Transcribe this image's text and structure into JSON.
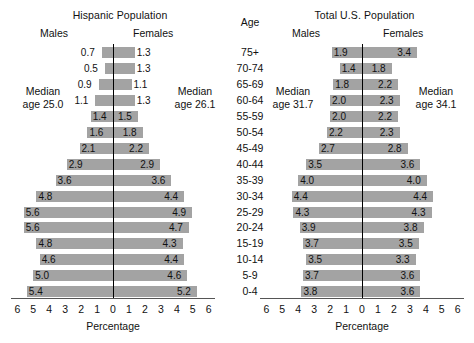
{
  "figure": {
    "age_header": "Age",
    "axis_caption": "Percentage",
    "males_label": "Males",
    "females_label": "Females",
    "bar_color": "#a3a3a3",
    "axis_color": "#000000"
  },
  "age_groups": [
    "75+",
    "70-74",
    "65-69",
    "60-64",
    "55-59",
    "50-54",
    "45-49",
    "40-44",
    "35-39",
    "30-34",
    "25-29",
    "20-24",
    "15-19",
    "10-14",
    "5-9",
    "0-4"
  ],
  "axis_ticks": [
    "6",
    "5",
    "4",
    "3",
    "2",
    "1",
    "0",
    "1",
    "2",
    "3",
    "4",
    "5",
    "6"
  ],
  "charts": [
    {
      "title": "Hispanic Population",
      "median_male": "Median\nage 25.0",
      "median_male_line1": "Median",
      "median_male_line2": "age 25.0",
      "median_female_line1": "Median",
      "median_female_line2": "age 26.1",
      "males": [
        "0.7",
        "0.5",
        "0.9",
        "1.1",
        "1.4",
        "1.6",
        "2.1",
        "2.9",
        "3.6",
        "4.8",
        "5.6",
        "5.6",
        "4.8",
        "4.6",
        "5.0",
        "5.4"
      ],
      "females": [
        "1.3",
        "1.3",
        "1.1",
        "1.3",
        "1.5",
        "1.8",
        "2.2",
        "2.9",
        "3.6",
        "4.4",
        "4.9",
        "4.7",
        "4.3",
        "4.4",
        "4.6",
        "5.2"
      ]
    },
    {
      "title": "Total U.S. Population",
      "median_male_line1": "Median",
      "median_male_line2": "age 31.7",
      "median_female_line1": "Median",
      "median_female_line2": "age 34.1",
      "males": [
        "1.9",
        "1.4",
        "1.8",
        "2.0",
        "2.0",
        "2.2",
        "2.7",
        "3.5",
        "4.0",
        "4.4",
        "4.3",
        "3.9",
        "3.7",
        "3.5",
        "3.7",
        "3.8"
      ],
      "females": [
        "3.4",
        "1.8",
        "2.2",
        "2.3",
        "2.2",
        "2.3",
        "2.8",
        "3.6",
        "4.0",
        "4.4",
        "4.3",
        "3.8",
        "3.5",
        "3.3",
        "3.6",
        "3.6"
      ]
    }
  ],
  "chart_data": {
    "type": "bar",
    "subtype": "population-pyramid",
    "categories": [
      "75+",
      "70-74",
      "65-69",
      "60-64",
      "55-59",
      "50-54",
      "45-49",
      "40-44",
      "35-39",
      "30-34",
      "25-29",
      "20-24",
      "15-19",
      "10-14",
      "5-9",
      "0-4"
    ],
    "xlabel": "Percentage",
    "ylabel": "Age",
    "xlim": [
      -6,
      6
    ],
    "xticks": [
      6,
      5,
      4,
      3,
      2,
      1,
      0,
      1,
      2,
      3,
      4,
      5,
      6
    ],
    "grid": false,
    "legend": "none",
    "panels": [
      {
        "title": "Hispanic Population",
        "median_age_males": 25.0,
        "median_age_females": 26.1,
        "series": [
          {
            "name": "Males",
            "side": "left",
            "values": [
              0.7,
              0.5,
              0.9,
              1.1,
              1.4,
              1.6,
              2.1,
              2.9,
              3.6,
              4.8,
              5.6,
              5.6,
              4.8,
              4.6,
              5.0,
              5.4
            ]
          },
          {
            "name": "Females",
            "side": "right",
            "values": [
              1.3,
              1.3,
              1.1,
              1.3,
              1.5,
              1.8,
              2.2,
              2.9,
              3.6,
              4.4,
              4.9,
              4.7,
              4.3,
              4.4,
              4.6,
              5.2
            ]
          }
        ]
      },
      {
        "title": "Total U.S. Population",
        "median_age_males": 31.7,
        "median_age_females": 34.1,
        "series": [
          {
            "name": "Males",
            "side": "left",
            "values": [
              1.9,
              1.4,
              1.8,
              2.0,
              2.0,
              2.2,
              2.7,
              3.5,
              4.0,
              4.4,
              4.3,
              3.9,
              3.7,
              3.5,
              3.7,
              3.8
            ]
          },
          {
            "name": "Females",
            "side": "right",
            "values": [
              3.4,
              1.8,
              2.2,
              2.3,
              2.2,
              2.3,
              2.8,
              3.6,
              4.0,
              4.4,
              4.3,
              3.8,
              3.5,
              3.3,
              3.6,
              3.6
            ]
          }
        ]
      }
    ]
  }
}
